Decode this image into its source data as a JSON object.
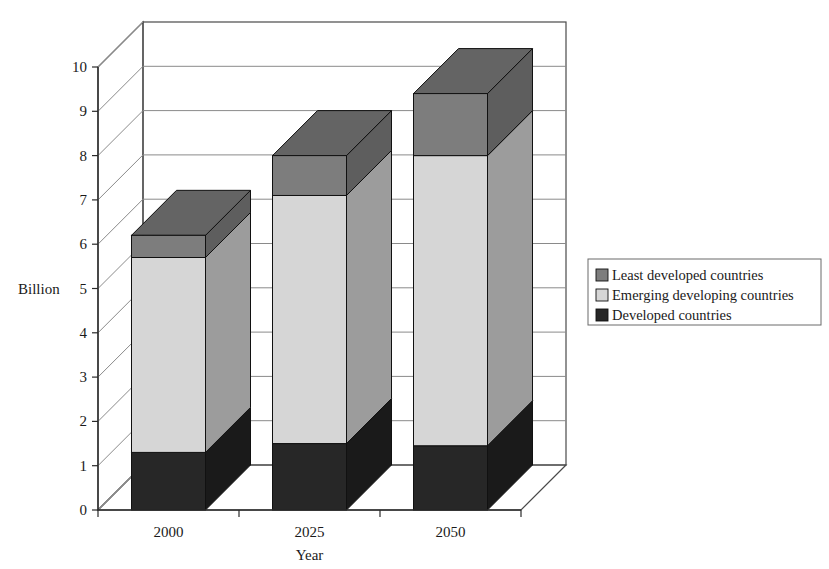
{
  "chart_data": {
    "type": "bar",
    "subtype": "stacked-3d-column",
    "title": "",
    "subtitle": "",
    "xlabel": "Year",
    "ylabel": "Billion",
    "categories": [
      "2000",
      "2025",
      "2050"
    ],
    "ylim": [
      0,
      10
    ],
    "ytick_step": 1,
    "yticks": [
      "0",
      "1",
      "2",
      "3",
      "4",
      "5",
      "6",
      "7",
      "8",
      "9",
      "10"
    ],
    "grid": true,
    "grid_axis": "y",
    "legend_position": "right",
    "stack_order_bottom_to_top": [
      "Developed countries",
      "Emerging developing countries",
      "Least developed countries"
    ],
    "series": [
      {
        "name": "Least developed countries",
        "color": "#7d7d7d",
        "values": [
          0.5,
          0.9,
          1.4
        ]
      },
      {
        "name": "Emerging developing countries",
        "color": "#d6d6d6",
        "values": [
          4.4,
          5.6,
          6.55
        ]
      },
      {
        "name": "Developed countries",
        "color": "#272727",
        "values": [
          1.3,
          1.5,
          1.45
        ]
      }
    ],
    "stack_totals": [
      6.2,
      8.0,
      9.4
    ],
    "cumulative_tops": {
      "developed": [
        1.3,
        1.5,
        1.45
      ],
      "emerging": [
        5.7,
        7.1,
        8.0
      ],
      "least": [
        6.2,
        8.0,
        9.4
      ]
    },
    "annotations": []
  },
  "legend": {
    "items": [
      {
        "label": "Least developed countries",
        "swatch": "#7d7d7d"
      },
      {
        "label": "Emerging developing countries",
        "swatch": "#d6d6d6"
      },
      {
        "label": "Developed countries",
        "swatch": "#272727"
      }
    ]
  },
  "axes": {
    "y_title": "Billion",
    "x_title": "Year",
    "y_ticks": [
      "10",
      "9",
      "8",
      "7",
      "6",
      "5",
      "4",
      "3",
      "2",
      "1",
      "0"
    ],
    "x_ticks": [
      "2000",
      "2025",
      "2050"
    ]
  },
  "colors": {
    "least_developed": "#7d7d7d",
    "least_developed_side": "#5e5e5e",
    "least_developed_top": "#646464",
    "emerging": "#d6d6d6",
    "emerging_side": "#9c9c9c",
    "emerging_top": "#bfbfbf",
    "developed": "#272727",
    "developed_side": "#1a1a1a",
    "developed_top": "#333333",
    "grid": "#8a8a8a",
    "frame": "#4a4a4a",
    "background": "#ffffff"
  }
}
